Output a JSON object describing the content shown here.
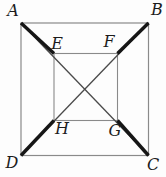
{
  "figure": {
    "background_color": "#fdfdfd",
    "square_stroke_color": "#8a8a8a",
    "diagonal_stroke_color": "#4a4a4a",
    "thick_segment_color": "#161616",
    "labels": {
      "A": "A",
      "B": "B",
      "C": "C",
      "D": "D",
      "E": "E",
      "F": "F",
      "G": "G",
      "H": "H"
    }
  }
}
